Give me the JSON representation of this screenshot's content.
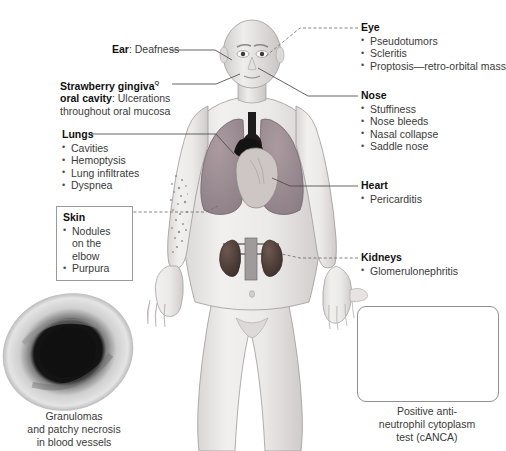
{
  "figure": {
    "background": "#ffffff"
  },
  "labels": [
    {
      "id": "ear",
      "heading": "Ear",
      "heading_suffix": ": Deafness",
      "items": []
    },
    {
      "id": "strawberry-gingiva",
      "heading": "Strawberry gingiva",
      "superscript": "Q",
      "heading2": "oral cavity",
      "heading_suffix": ": Ulcerations",
      "continuation": "throughout oral mucosa",
      "items": []
    },
    {
      "id": "lungs",
      "heading": "Lungs",
      "items": [
        "Cavities",
        "Hemoptysis",
        "Lung infiltrates",
        "Dyspnea"
      ]
    },
    {
      "id": "skin",
      "heading": "Skin",
      "boxed": true,
      "items": [
        "Nodules on",
        "the elbow",
        "Purpura"
      ]
    },
    {
      "id": "eye",
      "heading": "Eye",
      "items": [
        "Pseudotumors",
        "Scleritis",
        "Proptosis—retro-orbital mass"
      ]
    },
    {
      "id": "nose",
      "heading": "Nose",
      "items": [
        "Stuffiness",
        "Nose bleeds",
        "Nasal collapse",
        "Saddle nose"
      ]
    },
    {
      "id": "heart",
      "heading": "Heart",
      "items": [
        "Pericarditis"
      ]
    },
    {
      "id": "kidneys",
      "heading": "Kidneys",
      "items": [
        "Glomerulonephritis"
      ]
    }
  ],
  "ear": {
    "heading": "Ear",
    "text": ": Deafness"
  },
  "gingiva": {
    "heading": "Strawberry gingiva",
    "sup": "Q",
    "heading2": "oral cavity",
    "text": ": Ulcerations",
    "line2": "throughout oral mucosa"
  },
  "lungs": {
    "heading": "Lungs",
    "items": [
      "Cavities",
      "Hemoptysis",
      "Lung infiltrates",
      "Dyspnea"
    ]
  },
  "skin": {
    "heading": "Skin",
    "items": [
      "Nodules on the elbow",
      "Purpura"
    ]
  },
  "eye": {
    "heading": "Eye",
    "items": [
      "Pseudotumors",
      "Scleritis",
      "Proptosis—retro-orbital mass"
    ]
  },
  "nose": {
    "heading": "Nose",
    "items": [
      "Stuffiness",
      "Nose bleeds",
      "Nasal collapse",
      "Saddle nose"
    ]
  },
  "heart": {
    "heading": "Heart",
    "items": [
      "Pericarditis"
    ]
  },
  "kidneys": {
    "heading": "Kidneys",
    "items": [
      "Glomerulonephritis"
    ]
  },
  "captions": {
    "granuloma": [
      "Granulomas",
      "and patchy necrosis",
      "in blood vessels"
    ],
    "canca": [
      "Positive anti-",
      "neutrophil cytoplasm",
      "test (cANCA)"
    ]
  },
  "panels": {
    "granuloma_micrograph": "blood-vessel-cross-section-grayscale",
    "canca_panel": "three-neutrophils-immunofluorescence"
  },
  "body_figure": {
    "organs": [
      "lungs",
      "heart",
      "kidneys",
      "skin-purpura-arm"
    ],
    "colors": {
      "skin": "#e9e7e6",
      "lung": "#9a8c92",
      "heart": "#cdc6c4",
      "kidney": "#4a3b36",
      "outline": "#8c8c8c"
    }
  }
}
